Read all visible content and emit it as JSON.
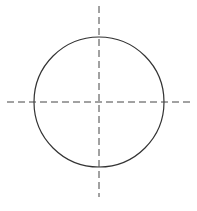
{
  "diagram": {
    "type": "circle-with-centerlines",
    "canvas": {
      "width": 197,
      "height": 211,
      "background": "#ffffff"
    },
    "circle": {
      "cx": 99,
      "cy": 102,
      "r": 65,
      "stroke": "#333333",
      "stroke_width": 1.2
    },
    "centerlines": {
      "stroke": "#444444",
      "stroke_width": 1,
      "dash": "7,4",
      "horizontal": {
        "x1": 7,
        "y1": 102,
        "x2": 193,
        "y2": 102
      },
      "vertical": {
        "x1": 99,
        "y1": 6,
        "x2": 99,
        "y2": 197
      }
    }
  }
}
